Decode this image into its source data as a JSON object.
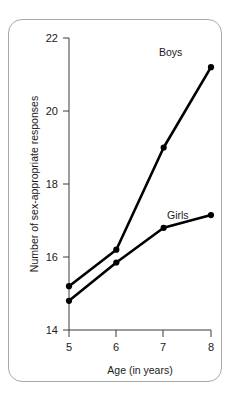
{
  "chart_data": {
    "type": "line",
    "title": "",
    "xlabel": "Age (in years)",
    "ylabel": "Number of sex-appropriate responses",
    "x": [
      5,
      6,
      7,
      8
    ],
    "xticklabels": [
      "5",
      "6",
      "7",
      "8"
    ],
    "yticks": [
      14,
      16,
      18,
      20,
      22
    ],
    "yticklabels": [
      "14",
      "16",
      "18",
      "20",
      "22"
    ],
    "xlim": [
      5,
      8
    ],
    "ylim": [
      14,
      22
    ],
    "grid": false,
    "legend": "inline-annotations",
    "series": [
      {
        "name": "Boys",
        "values": [
          15.2,
          16.2,
          19.0,
          21.2
        ],
        "color": "#000000",
        "marker": "circle"
      },
      {
        "name": "Girls",
        "values": [
          14.8,
          15.85,
          16.8,
          17.15
        ],
        "color": "#000000",
        "marker": "circle"
      }
    ],
    "annotations": [
      {
        "text": "Boys",
        "x": 7.35,
        "y": 21.6
      },
      {
        "text": "Girls",
        "x": 7.55,
        "y": 16.45
      }
    ]
  },
  "axis": {
    "y_tick_22": "22",
    "y_tick_20": "20",
    "y_tick_18": "18",
    "y_tick_16": "16",
    "y_tick_14": "14",
    "x_tick_5": "5",
    "x_tick_6": "6",
    "x_tick_7": "7",
    "x_tick_8": "8",
    "x_title": "Age (in years)",
    "y_title": "Number of sex-appropriate responses"
  },
  "labels": {
    "boys": "Boys",
    "girls": "Girls"
  }
}
